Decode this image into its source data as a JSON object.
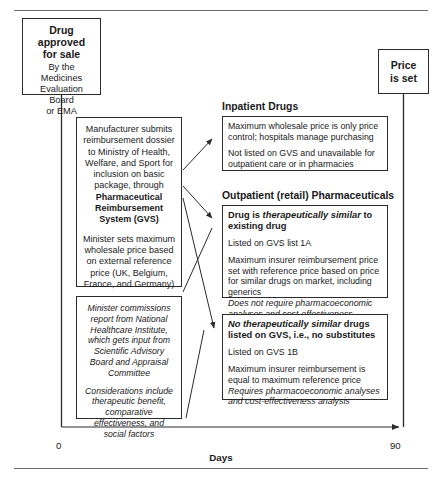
{
  "diagram": {
    "nodes": {
      "drug_approved": {
        "title_lines": [
          "Drug",
          "approved",
          "for sale"
        ],
        "subtitle_lines": [
          "By the Medicines",
          "Evaluation Board",
          "or EMA"
        ]
      },
      "price_set": {
        "title_lines": [
          "Price",
          "is set"
        ]
      },
      "manufacturer": {
        "paragraph_1_plain": "Manufacturer submits reimbursement dossier to Ministry of Health, Welfare, and Sport for inclusion on basic package, through ",
        "paragraph_1_bold": "Pharmaceutical Reimbursement System (GVS)",
        "paragraph_2": "Minister sets maximum wholesale price based on external reference price (UK, Belgium, France, and Germany)"
      },
      "minister_report": {
        "paragraph_1": "Minister commissions report from National Healthcare Institute, which gets input from Scientific Advisory Board and Appraisal Committee",
        "paragraph_2": "Considerations include therapeutic benefit, comparative effectiveness, and social factors"
      }
    },
    "sections": [
      {
        "heading": "Inpatient Drugs",
        "box": {
          "line_1": "Maximum wholesale price is only price control; hospitals manage purchasing",
          "line_2": "Not listed on GVS and unavailable for outpatient care or in pharmacies"
        }
      },
      {
        "heading": "Outpatient (retail) Pharmaceuticals",
        "box_similar": {
          "lead_prefix": "Drug is ",
          "lead_italic": "therapeutically similar",
          "lead_suffix": " to existing drug",
          "listed": "Listed on GVS list 1A",
          "detail": "Maximum insurer reimbursement price set with reference price based on price for similar drugs on market, including generics",
          "note": "Does not require pharmacoeconomic analyses and cost-effectiveness analysis"
        },
        "box_no_substitute": {
          "lead_italic": "No therapeutically similar",
          "lead_suffix": " drugs listed on GVS, i.e., no substitutes",
          "listed": "Listed on GVS 1B",
          "detail": "Maximum insurer reimbursement is equal to maximum reference price",
          "note": "Requires pharmacoeconomic analyses and cost-effectiveness analysis"
        }
      }
    ],
    "timeline": {
      "start_label": "0",
      "end_label": "90",
      "axis_title": "Days"
    },
    "colors": {
      "stroke": "#2b2b2b",
      "text": "#1a1a1a",
      "rule": "#6d6d6d",
      "background": "#ffffff"
    }
  }
}
